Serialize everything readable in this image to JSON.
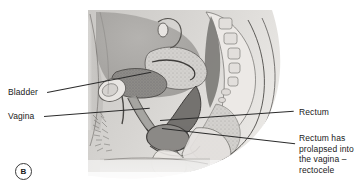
{
  "figure": {
    "panel_marker": "B",
    "illustration_name": "sagittal-section-female-pelvis-rectocele",
    "background_color": "#ffffff",
    "line_color": "#2b2b2b",
    "text_color": "#1a1a1a"
  },
  "labels": {
    "bladder": "Bladder",
    "vagina": "Vagina",
    "rectum": "Rectum",
    "rectocele_line1": "Rectum has",
    "rectocele_line2": "prolapsed into",
    "rectocele_line3": "the vagina –",
    "rectocele_line4": "rectocele"
  },
  "palette": {
    "skin_light": "#d8d6d3",
    "skin_mid": "#bcb9b5",
    "tissue_dark": "#8a8885",
    "organ_dark": "#6f6d6b",
    "bone_light": "#eceae7",
    "outline": "#4a4846",
    "cavity": "#7d7b78"
  }
}
